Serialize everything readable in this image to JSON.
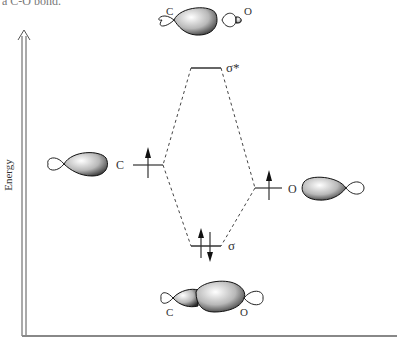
{
  "caption_fragment": "a C-O bond.",
  "axis": {
    "ylabel": "Energy"
  },
  "levels": {
    "sigma_star": {
      "label": "σ*"
    },
    "sigma": {
      "label": "σ"
    },
    "carbon_ao": {
      "label": "C"
    },
    "oxygen_ao": {
      "label": "O"
    }
  },
  "orbitals": {
    "antibonding": {
      "left_label": "C",
      "right_label": "O"
    },
    "bonding": {
      "left_label": "C",
      "right_label": "O"
    }
  }
}
